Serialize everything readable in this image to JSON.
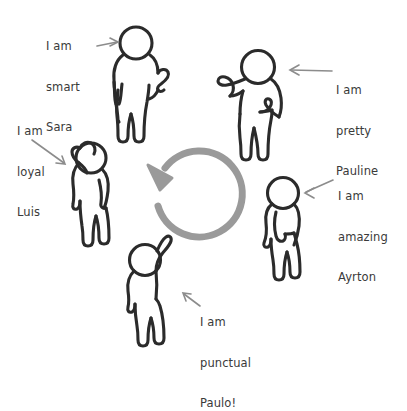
{
  "diagram": {
    "background_color": "#ffffff",
    "figure_outline_color": "#2b2b2b",
    "arrow_color": "#8c8c8c",
    "text_color": "#3a3a3a",
    "center_arrow": {
      "name": "circular-rotation-arrow",
      "direction": "counterclockwise",
      "color": "#9a9a9a"
    },
    "people": [
      {
        "id": "sara",
        "pose": "waving-one-hand",
        "label": {
          "lines": [
            "I am",
            "smart",
            "Sara"
          ],
          "text": "I am smart Sara",
          "arrow": "points-right"
        }
      },
      {
        "id": "pauline",
        "pose": "hand-on-hip-arm-out",
        "label": {
          "lines": [
            "I am",
            "pretty",
            "Pauline"
          ],
          "text": "I am pretty Pauline",
          "arrow": "points-left"
        }
      },
      {
        "id": "ayrton",
        "pose": "standing-arms-down",
        "label": {
          "lines": [
            "I am",
            "amazing",
            "Ayrton"
          ],
          "text": "I am amazing Ayrton",
          "arrow": "points-left"
        }
      },
      {
        "id": "paulo",
        "pose": "one-arm-raised",
        "label": {
          "lines": [
            "I am",
            "punctual",
            "Paulo!"
          ],
          "text": "I am punctual Paulo!",
          "arrow": "points-up-left"
        }
      },
      {
        "id": "luis",
        "pose": "hand-behind-head",
        "label": {
          "lines": [
            "I am",
            "loyal",
            "Luis"
          ],
          "text": "I am loyal Luis",
          "arrow": "points-down-right"
        }
      }
    ]
  }
}
